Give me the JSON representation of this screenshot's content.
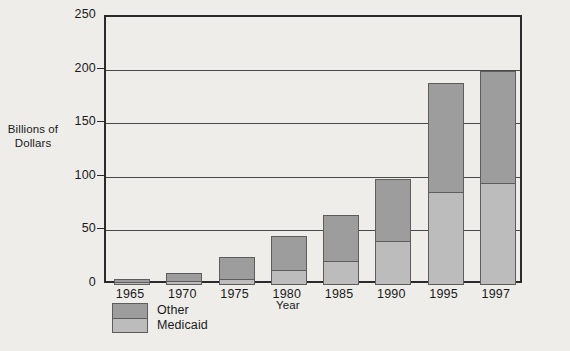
{
  "chart_data": {
    "type": "bar",
    "subtype": "stacked-vertical",
    "title": "",
    "xlabel": "Year",
    "ylabel": "Billions of Dollars",
    "categories": [
      "1965",
      "1970",
      "1975",
      "1980",
      "1985",
      "1990",
      "1995",
      "1997"
    ],
    "series": [
      {
        "name": "Medicaid",
        "values": [
          3,
          4,
          6,
          14,
          22,
          41,
          87,
          95
        ],
        "color": "#bcbcbc"
      },
      {
        "name": "Other",
        "values": [
          3,
          7,
          20,
          32,
          43,
          58,
          101,
          105
        ],
        "color": "#9d9d9d"
      }
    ],
    "totals": [
      6,
      11,
      26,
      46,
      65,
      99,
      188,
      200
    ],
    "ylim": [
      0,
      250
    ],
    "yticks": [
      0,
      50,
      100,
      150,
      200,
      250
    ],
    "ytick_labels": [
      "0",
      "50",
      "100",
      "150",
      "200",
      "250"
    ],
    "grid": true,
    "grid_axis": "y",
    "legend_position": "bottom-left",
    "legend_order_top_to_bottom": [
      "Other",
      "Medicaid"
    ]
  },
  "axes": {
    "y_title_line1": "Billions of",
    "y_title_line2": "Dollars",
    "x_title": "Year"
  },
  "legend": {
    "items": [
      {
        "label": "Other",
        "color": "#9d9d9d"
      },
      {
        "label": "Medicaid",
        "color": "#bcbcbc"
      }
    ]
  },
  "caption": {
    "text": ""
  },
  "colors": {
    "background": "#eeedea",
    "frame": "#2b2b2b",
    "gridline": "#4a4a4a",
    "bar_other": "#9d9d9d",
    "bar_medicaid": "#bcbcbc",
    "bar_outline": "#5d5d5d",
    "text": "#1a1a1a"
  }
}
